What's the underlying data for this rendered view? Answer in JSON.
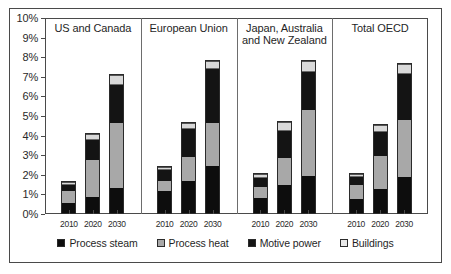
{
  "top_clipped_text": "",
  "chart_data": {
    "type": "bar",
    "subtype": "stacked-bar-small-multiples",
    "title": "",
    "xlabel": "",
    "ylabel": "",
    "ylim": [
      0,
      10
    ],
    "y_unit": "%",
    "grid": false,
    "legend_position": "bottom",
    "categories": [
      "2010",
      "2020",
      "2030"
    ],
    "series": [
      {
        "name": "Process steam",
        "color": "#0d0d0d"
      },
      {
        "name": "Process heat",
        "color": "#a8a8a8"
      },
      {
        "name": "Motive power",
        "color": "#141414"
      },
      {
        "name": "Buildings",
        "color": "#d9d9d9"
      }
    ],
    "y_ticks": [
      "0%",
      "1%",
      "2%",
      "3%",
      "4%",
      "5%",
      "6%",
      "7%",
      "8%",
      "9%",
      "10%"
    ],
    "panels": [
      {
        "name": "US and Canada",
        "bars": [
          {
            "category": "2010",
            "process_steam": 0.55,
            "process_heat": 0.65,
            "motive_power": 0.4,
            "buildings": 0.1,
            "total": 1.7
          },
          {
            "category": "2020",
            "process_steam": 0.85,
            "process_heat": 1.95,
            "motive_power": 1.05,
            "buildings": 0.3,
            "total": 4.15
          },
          {
            "category": "2030",
            "process_steam": 1.3,
            "process_heat": 3.35,
            "motive_power": 2.05,
            "buildings": 0.45,
            "total": 7.15
          }
        ]
      },
      {
        "name": "European Union",
        "bars": [
          {
            "category": "2010",
            "process_steam": 1.15,
            "process_heat": 0.55,
            "motive_power": 0.65,
            "buildings": 0.1,
            "total": 2.45
          },
          {
            "category": "2020",
            "process_steam": 1.65,
            "process_heat": 1.25,
            "motive_power": 1.55,
            "buildings": 0.25,
            "total": 4.7
          },
          {
            "category": "2030",
            "process_steam": 2.45,
            "process_heat": 2.2,
            "motive_power": 2.85,
            "buildings": 0.35,
            "total": 7.85
          }
        ]
      },
      {
        "name": "Japan, Australia and New Zealand",
        "bars": [
          {
            "category": "2010",
            "process_steam": 0.8,
            "process_heat": 0.6,
            "motive_power": 0.55,
            "buildings": 0.15,
            "total": 2.1
          },
          {
            "category": "2020",
            "process_steam": 1.45,
            "process_heat": 1.4,
            "motive_power": 1.5,
            "buildings": 0.4,
            "total": 4.75
          },
          {
            "category": "2030",
            "process_steam": 1.9,
            "process_heat": 3.45,
            "motive_power": 2.0,
            "buildings": 0.5,
            "total": 7.85
          }
        ]
      },
      {
        "name": "Total OECD",
        "bars": [
          {
            "category": "2010",
            "process_steam": 0.75,
            "process_heat": 0.75,
            "motive_power": 0.5,
            "buildings": 0.1,
            "total": 2.1
          },
          {
            "category": "2020",
            "process_steam": 1.25,
            "process_heat": 1.7,
            "motive_power": 1.35,
            "buildings": 0.3,
            "total": 4.6
          },
          {
            "category": "2030",
            "process_steam": 1.85,
            "process_heat": 2.95,
            "motive_power": 2.45,
            "buildings": 0.45,
            "total": 7.7
          }
        ]
      }
    ]
  }
}
